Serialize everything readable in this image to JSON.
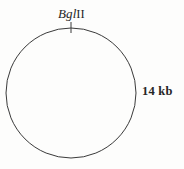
{
  "figure": {
    "kind": "circular-restriction-map",
    "background_color": "#fdfdfc",
    "stroke_color": "#3a3a3a",
    "text_color": "#262626"
  },
  "circle": {
    "center_x": 71,
    "center_y": 93,
    "radius": 65,
    "stroke_width": 1
  },
  "site_marker": {
    "name": "BglII",
    "enzyme_italic_part": "Bgl",
    "enzyme_roman_part": "II",
    "angle_deg": 0,
    "tick_x": 71,
    "tick_y1": 22,
    "tick_y2": 33
  },
  "size_annotation": {
    "text": "14 kb",
    "value": 14,
    "unit": "kb"
  }
}
